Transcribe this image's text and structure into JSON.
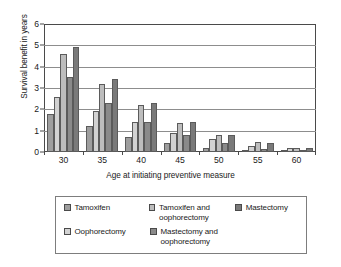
{
  "chart_data": {
    "type": "bar",
    "title": "",
    "xlabel": "Age at initiating preventive measure",
    "ylabel": "Survival benefit in years",
    "categories": [
      "30",
      "35",
      "40",
      "45",
      "50",
      "55",
      "60"
    ],
    "ylim": [
      0,
      6
    ],
    "yticks": [
      0,
      1,
      2,
      3,
      4,
      5,
      6
    ],
    "grid": true,
    "legend_position": "bottom",
    "series": [
      {
        "name": "Tamoxifen",
        "color": "#9e9e9e",
        "values": [
          1.8,
          1.2,
          0.7,
          0.4,
          0.2,
          0.1,
          0.05
        ]
      },
      {
        "name": "Oophorectomy",
        "color": "#d2d2d2",
        "values": [
          2.6,
          1.9,
          1.4,
          0.9,
          0.6,
          0.3,
          0.2
        ]
      },
      {
        "name": "Tamoxifen and\noophorectomy",
        "color": "#bdbdbd",
        "values": [
          4.6,
          3.2,
          2.2,
          1.35,
          0.8,
          0.45,
          0.2
        ]
      },
      {
        "name": "Mastectomy and\noophorectomy",
        "color": "#8a8a8a",
        "values": [
          3.5,
          2.3,
          1.4,
          0.8,
          0.4,
          0.15,
          0.1
        ]
      },
      {
        "name": "Mastectomy",
        "color": "#7a7a7a",
        "values": [
          4.9,
          3.4,
          2.3,
          1.4,
          0.8,
          0.4,
          0.2
        ]
      }
    ]
  },
  "legend": {
    "entries": [
      {
        "label": "Tamoxifen",
        "color": "#9e9e9e"
      },
      {
        "label": "Tamoxifen and\noophorectomy",
        "color": "#bdbdbd"
      },
      {
        "label": "Mastectomy",
        "color": "#7a7a7a"
      },
      {
        "label": "Oophorectomy",
        "color": "#d2d2d2"
      },
      {
        "label": "Mastectomy and\noophorectomy",
        "color": "#8a8a8a"
      }
    ]
  }
}
